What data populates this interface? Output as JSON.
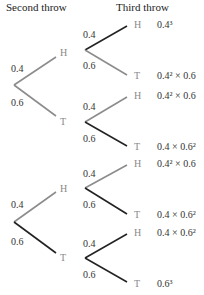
{
  "headers": {
    "second": "Second throw",
    "third": "Third throw"
  },
  "colors": {
    "gray": "#8c8c8c",
    "black": "#222222"
  },
  "trees": [
    {
      "root_p_up": "0.4",
      "root_p_down": "0.6",
      "mid_up": "H",
      "mid_down": "T",
      "sub_up": {
        "p_up": "0.4",
        "p_down": "0.6",
        "leaf_up": "H",
        "leaf_down": "T",
        "res_up": "0.4³",
        "res_down": "0.4² × 0.6"
      },
      "sub_down": {
        "p_up": "0.4",
        "p_down": "0.6",
        "leaf_up": "H",
        "leaf_down": "T",
        "res_up": "0.4² × 0.6",
        "res_down": "0.4 × 0.6²"
      }
    },
    {
      "root_p_up": "0.4",
      "root_p_down": "0.6",
      "mid_up": "H",
      "mid_down": "T",
      "sub_up": {
        "p_up": "0.4",
        "p_down": "0.6",
        "leaf_up": "H",
        "leaf_down": "T",
        "res_up": "0.4² × 0.6",
        "res_down": "0.4 × 0.6²"
      },
      "sub_down": {
        "p_up": "0.4",
        "p_down": "0.6",
        "leaf_up": "H",
        "leaf_down": "T",
        "res_up": "0.4 × 0.6²",
        "res_down": "0.6³"
      }
    }
  ]
}
